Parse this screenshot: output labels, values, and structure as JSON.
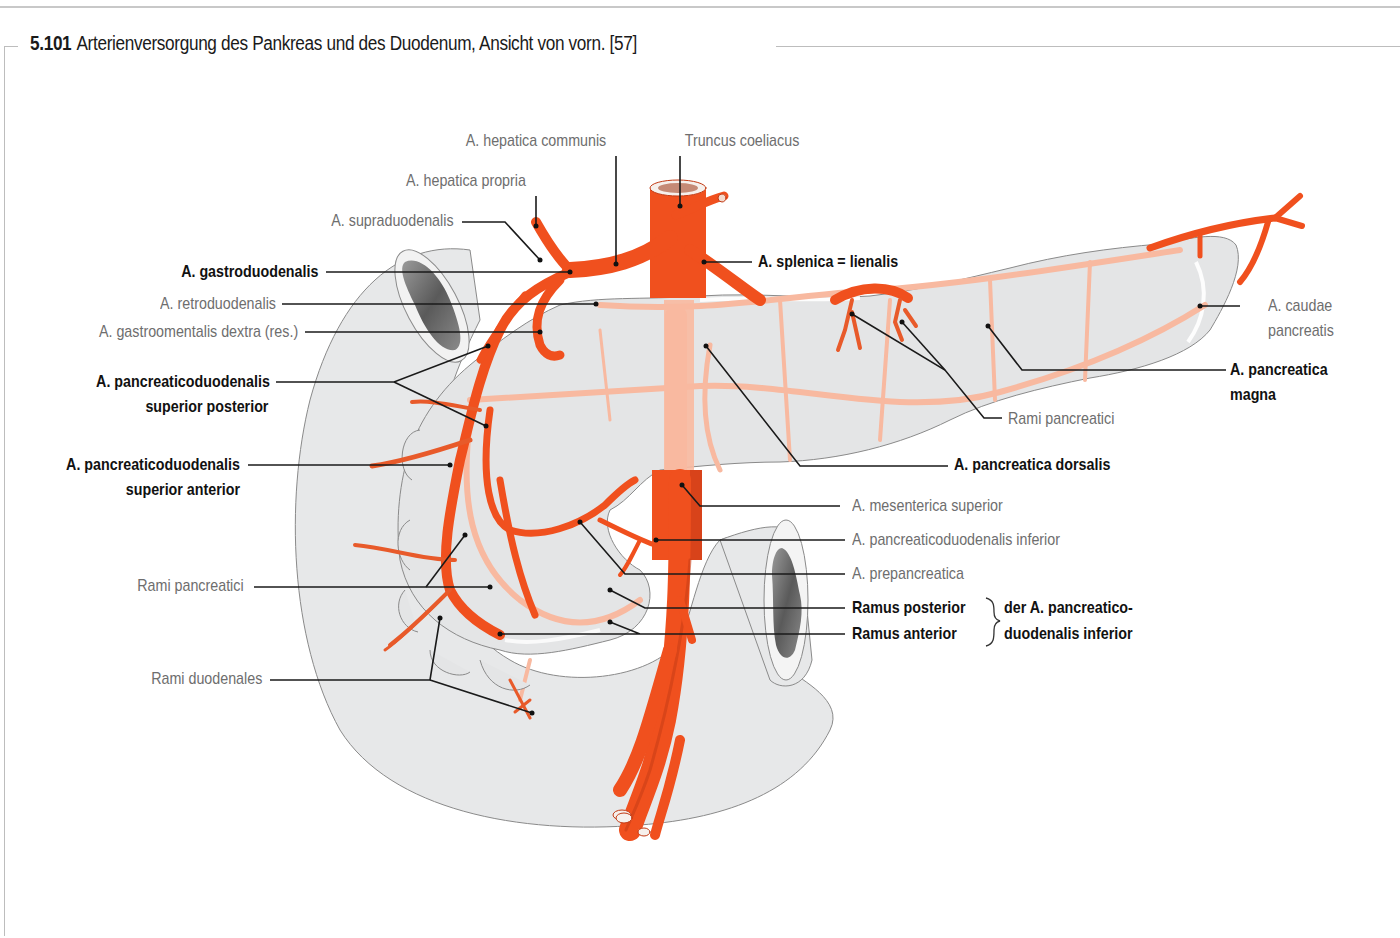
{
  "figure": {
    "number": "5.101",
    "title": "Arterienversorgung des Pankreas und des Duodenum, Ansicht von vorn. [57]"
  },
  "colors": {
    "artery": "#f0501e",
    "artery_dark": "#c23a14",
    "pancreas_vessel": "#f8b9a0",
    "organ_fill": "#e6e7e8",
    "organ_outline": "#8a8a8a",
    "label_bold": "#111111",
    "label_regular": "#6e6e6e",
    "leader_line": "#1a1a1a"
  },
  "labels": {
    "hepatica_communis": "A. hepatica communis",
    "truncus_coeliacus": "Truncus coeliacus",
    "hepatica_propria": "A. hepatica propria",
    "supraduodenalis": "A. supraduodenalis",
    "gastroduodenalis": "A. gastroduodenalis",
    "splenica": "A. splenica = lienalis",
    "retroduodenalis": "A. retroduodenalis",
    "gastroomentalis": "A. gastroomentalis dextra (res.)",
    "pd_sup_post_1": "A. pancreaticoduodenalis",
    "pd_sup_post_2": "superior posterior",
    "pd_sup_ant_1": "A. pancreaticoduodenalis",
    "pd_sup_ant_2": "superior anterior",
    "caudae_1": "A. caudae",
    "caudae_2": "pancreatis",
    "magna_1": "A. pancreatica",
    "magna_2": "magna",
    "rami_pancreatici_right": "Rami pancreatici",
    "dorsalis": "A. pancreatica dorsalis",
    "mesenterica_superior": "A. mesenterica superior",
    "pd_inferior": "A. pancreaticoduodenalis inferior",
    "prepancreatica": "A. prepancreatica",
    "ramus_posterior": "Ramus posterior",
    "ramus_anterior": "Ramus anterior",
    "der_1": "der A. pancreatico-",
    "der_2": "duodenalis inferior",
    "rami_pancreatici_left": "Rami pancreatici",
    "rami_duodenales": "Rami duodenales"
  }
}
